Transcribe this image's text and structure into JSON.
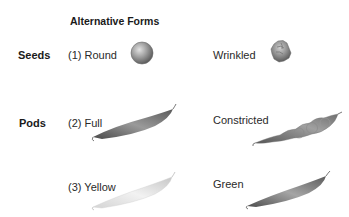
{
  "header": {
    "title": "Alternative Forms"
  },
  "rows": [
    {
      "label": "Seeds"
    },
    {
      "label": "Pods"
    }
  ],
  "traits": {
    "seed_round": {
      "label": "(1) Round",
      "icon": "round-seed-icon"
    },
    "seed_wrinkled": {
      "label": "Wrinkled",
      "icon": "wrinkled-seed-icon"
    },
    "pod_full": {
      "label": "(2) Full",
      "icon": "full-pod-icon"
    },
    "pod_constricted": {
      "label": "Constricted",
      "icon": "constricted-pod-icon"
    },
    "pod_yellow": {
      "label": "(3) Yellow",
      "icon": "yellow-pod-icon"
    },
    "pod_green": {
      "label": "Green",
      "icon": "green-pod-icon"
    }
  }
}
